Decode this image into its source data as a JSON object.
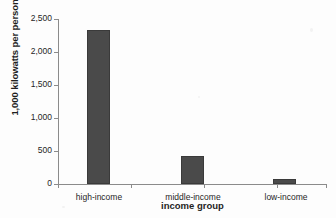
{
  "chart_data": {
    "type": "bar",
    "title": "",
    "xlabel": "income group",
    "ylabel": "1,000 kilowatts per person",
    "categories": [
      "high-income",
      "middle-income",
      "low-income"
    ],
    "values": [
      2330,
      425,
      80
    ],
    "series": [
      {
        "name": "electricity use per person",
        "values": [
          2330,
          425,
          80
        ]
      }
    ],
    "ylim": [
      0,
      2500
    ],
    "y_ticks": [
      0,
      500,
      1000,
      1500,
      2000,
      2500
    ],
    "y_tick_labels": [
      "0",
      "500",
      "1,000",
      "1,500",
      "2,000",
      "2,500"
    ],
    "grid": false,
    "legend": "none",
    "bar_color": "#4a4a4a",
    "axis_color": "#8b8b8b",
    "background_color": "#fdfdfd"
  }
}
